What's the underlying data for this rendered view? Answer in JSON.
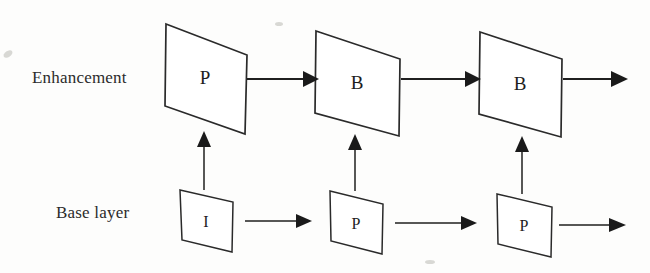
{
  "diagram": {
    "background_color": "#fdfdfc",
    "stroke_color": "#1f1f1f",
    "rows": [
      {
        "id": "enhancement",
        "label": "Enhancement",
        "nodes": [
          {
            "id": "enh-1",
            "letter": "P"
          },
          {
            "id": "enh-2",
            "letter": "B"
          },
          {
            "id": "enh-3",
            "letter": "B"
          }
        ]
      },
      {
        "id": "base",
        "label": "Base layer",
        "nodes": [
          {
            "id": "base-1",
            "letter": "I"
          },
          {
            "id": "base-2",
            "letter": "P"
          },
          {
            "id": "base-3",
            "letter": "P"
          }
        ]
      }
    ],
    "connections": {
      "enhancement_forward": [
        "enh-1 to enh-2",
        "enh-2 to enh-3",
        "enh-3 to next"
      ],
      "base_forward": [
        "base-1 to base-2",
        "base-2 to base-3",
        "base-3 to next"
      ],
      "upward": [
        "base-1 to enh-1",
        "base-2 to enh-2",
        "base-3 to enh-3"
      ]
    }
  }
}
